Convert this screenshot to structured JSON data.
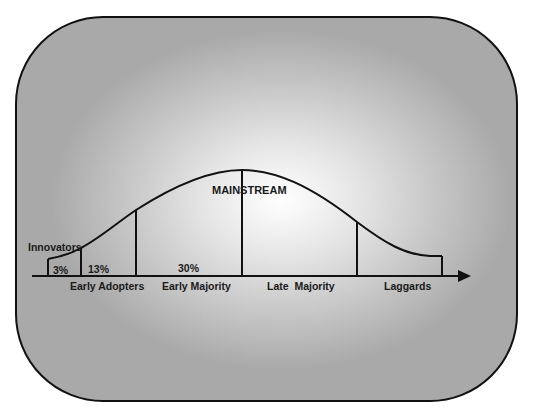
{
  "diagram": {
    "title": "MAINSTREAM",
    "segments": [
      {
        "name": "Innovators",
        "percent": "3%"
      },
      {
        "name": "Early Adopters",
        "percent": "13%"
      },
      {
        "name": "Early Majority",
        "percent": "30%"
      },
      {
        "name": "Late  Majority",
        "percent": ""
      },
      {
        "name": "Laggards",
        "percent": ""
      }
    ],
    "colors": {
      "line": "#111111",
      "background_center": "#ffffff",
      "background_edge": "#a9a9a9"
    }
  }
}
